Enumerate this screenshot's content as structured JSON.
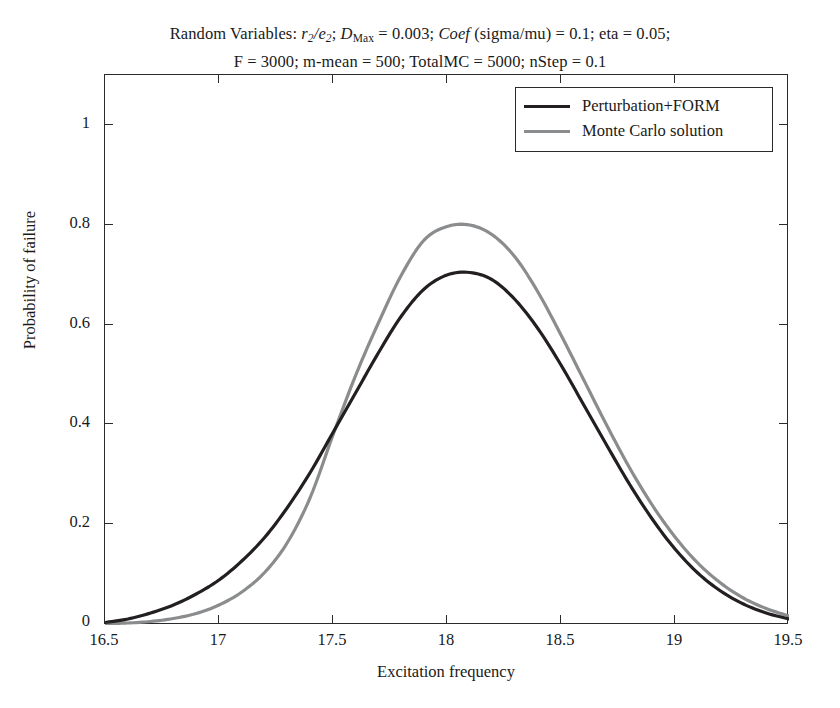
{
  "figure": {
    "title_lines": [
      "Random Variables: r2/e2; DMax = 0.003; Coef (sigma/mu) = 0.1; eta = 0.05;",
      "F = 3000; m-mean = 500; TotalMC = 5000; nStep = 0.1"
    ],
    "title_line2": "F = 3000; m-mean = 500; TotalMC = 5000; nStep = 0.1",
    "title_parts": {
      "prefix": "Random Variables: ",
      "r_var": "r",
      "r_sub": "2",
      "slash": "/",
      "e_var": "e",
      "e_sub": "2",
      "semi1": "; ",
      "d_var": "D",
      "d_sub": "Max",
      "d_val": " = 0.003; ",
      "coef": "Coef",
      "coef_args": " (sigma/mu) = 0.1; eta = 0.05;"
    }
  },
  "axis": {
    "xlabel": "Excitation frequency",
    "ylabel": "Probability of failure",
    "xticks": [
      "16.5",
      "17",
      "17.5",
      "18",
      "18.5",
      "19",
      "19.5"
    ],
    "yticks": [
      "0",
      "0.2",
      "0.4",
      "0.6",
      "0.8",
      "1"
    ]
  },
  "legend": {
    "entries": [
      {
        "label": "Perturbation+FORM",
        "color": "#231f20",
        "icon": "line-swatch"
      },
      {
        "label": "Monte Carlo solution",
        "color": "#8a8c8e",
        "icon": "line-swatch"
      }
    ]
  },
  "chart_data": {
    "type": "line",
    "title": "Random Variables: r2/e2; DMax = 0.003; Coef (sigma/mu) = 0.1; eta = 0.05; F = 3000; m-mean = 500; TotalMC = 5000; nStep = 0.1",
    "xlabel": "Excitation frequency",
    "ylabel": "Probability of failure",
    "xlim": [
      16.5,
      19.5
    ],
    "ylim": [
      0,
      1.1
    ],
    "xticks": [
      16.5,
      17,
      17.5,
      18,
      18.5,
      19,
      19.5
    ],
    "yticks": [
      0,
      0.2,
      0.4,
      0.6,
      0.8,
      1
    ],
    "grid": false,
    "legend_position": "top-right",
    "x": [
      16.5,
      16.6,
      16.7,
      16.8,
      16.9,
      17.0,
      17.1,
      17.2,
      17.3,
      17.4,
      17.5,
      17.6,
      17.7,
      17.8,
      17.9,
      18.0,
      18.1,
      18.2,
      18.3,
      18.4,
      18.5,
      18.6,
      18.7,
      18.8,
      18.9,
      19.0,
      19.1,
      19.2,
      19.3,
      19.4,
      19.5
    ],
    "series": [
      {
        "name": "Perturbation+FORM",
        "color": "#231f20",
        "values": [
          0.005,
          0.012,
          0.024,
          0.04,
          0.062,
          0.09,
          0.128,
          0.175,
          0.235,
          0.305,
          0.385,
          0.465,
          0.545,
          0.618,
          0.672,
          0.7,
          0.705,
          0.69,
          0.65,
          0.592,
          0.52,
          0.44,
          0.36,
          0.282,
          0.212,
          0.152,
          0.104,
          0.068,
          0.042,
          0.024,
          0.012
        ]
      },
      {
        "name": "Monte Carlo solution",
        "color": "#8a8c8e",
        "values": [
          0.003,
          0.004,
          0.007,
          0.013,
          0.023,
          0.04,
          0.066,
          0.105,
          0.165,
          0.255,
          0.38,
          0.5,
          0.605,
          0.7,
          0.77,
          0.797,
          0.8,
          0.78,
          0.735,
          0.665,
          0.58,
          0.49,
          0.4,
          0.315,
          0.24,
          0.176,
          0.124,
          0.084,
          0.054,
          0.033,
          0.018
        ]
      }
    ],
    "annotations": [
      {
        "text": "curves cross near x = 17.5 at y ~ 0.385"
      },
      {
        "text": "Monte Carlo peak 0.80 at x = 18.1"
      },
      {
        "text": "Perturbation+FORM peak 0.705 at x = 18.1"
      }
    ]
  },
  "colors": {
    "perturbation_form": "#231f20",
    "monte_carlo": "#8a8c8e",
    "axis": "#2b2b2b",
    "background": "#ffffff"
  }
}
